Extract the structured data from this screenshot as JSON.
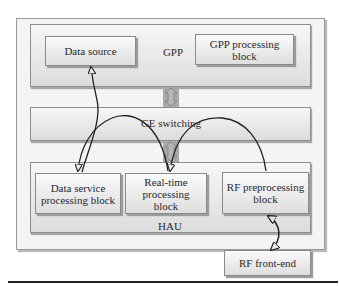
{
  "diagram": {
    "layers": {
      "gpp": {
        "label": "GPP"
      },
      "ge": {
        "label": "GE switching"
      },
      "hau": {
        "label": "HAU"
      }
    },
    "blocks": {
      "data_source": {
        "label": "Data source"
      },
      "gpp_processing": {
        "label": "GPP processing block"
      },
      "data_service_processing": {
        "label": "Data service processing block"
      },
      "real_time_processing": {
        "label": "Real-time processing block"
      },
      "rf_preprocessing": {
        "label": "RF preprocessing block"
      },
      "rf_front_end": {
        "label": "RF front-end"
      }
    },
    "connections": [
      {
        "from": "Data service processing block",
        "to": "Data source",
        "style": "curved-arrow"
      },
      {
        "from": "Real-time processing block",
        "to": "Data service processing block",
        "style": "curved-arrow-over-GE"
      },
      {
        "from": "RF preprocessing block",
        "to": "Real-time processing block",
        "style": "curved-arrow-over-GE"
      },
      {
        "from": "RF preprocessing block",
        "to": "RF front-end",
        "style": "bidirectional-curved-arrow"
      },
      {
        "from": "GPP",
        "to": "GE switching",
        "style": "bidirectional-block-arrow"
      },
      {
        "from": "GE switching",
        "to": "HAU",
        "style": "bidirectional-block-arrow"
      }
    ],
    "colors": {
      "block_fill_top": "#fbfbfb",
      "block_fill_bottom": "#dedede",
      "border": "#8a8a8a",
      "connector": "#a9a9a9",
      "arrow": "#222222"
    }
  }
}
